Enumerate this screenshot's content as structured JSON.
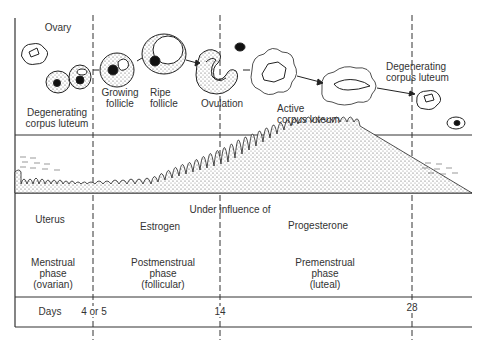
{
  "ovary": {
    "title": "Ovary",
    "stages": [
      {
        "id": "degenerating-left",
        "line1": "Degenerating",
        "line2": "corpus luteum"
      },
      {
        "id": "growing",
        "line1": "Growing",
        "line2": "follicle"
      },
      {
        "id": "ripe",
        "line1": "Ripe",
        "line2": "follicle"
      },
      {
        "id": "ovulation",
        "line1": "Ovulation"
      },
      {
        "id": "active",
        "line1": "Active",
        "line2": "corpus luteum"
      },
      {
        "id": "degenerating-right",
        "line1": "Degenerating",
        "line2": "corpus luteum"
      }
    ]
  },
  "uterus": {
    "title": "Uterus",
    "influence_label": "Under influence of",
    "hormones": [
      "Estrogen",
      "Progesterone"
    ],
    "phases": [
      {
        "line1": "Menstrual",
        "line2": "phase",
        "line3": "(ovarian)"
      },
      {
        "line1": "Postmenstrual",
        "line2": "phase",
        "line3": "(follicular)"
      },
      {
        "line1": "Premenstrual",
        "line2": "phase",
        "line3": "(luteal)"
      }
    ]
  },
  "days": {
    "label": "Days",
    "ticks": [
      "4 or 5",
      "14",
      "28"
    ]
  }
}
